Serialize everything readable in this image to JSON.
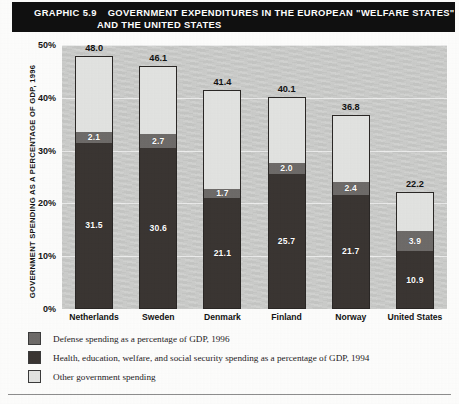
{
  "header": {
    "graphic_number": "GRAPHIC 5.9",
    "title_line_1": "GOVERNMENT EXPENDITURES IN THE EUROPEAN \"WELFARE STATES\"",
    "title_line_2": "AND THE UNITED STATES"
  },
  "colors": {
    "defense": "#6e6b69",
    "health": "#3a3532",
    "other": "#e2e3e1",
    "header_band": "#101010",
    "plot_background": "#c9cac8"
  },
  "legend": {
    "items": [
      {
        "key": "defense",
        "label": "Defense spending as a percentage of GDP, 1996"
      },
      {
        "key": "health",
        "label": "Health, education, welfare, and social security spending as a percentage of GDP, 1994"
      },
      {
        "key": "other",
        "label": "Other government spending"
      }
    ]
  },
  "chart_data": {
    "type": "bar",
    "subtype": "stacked",
    "title": "GOVERNMENT EXPENDITURES IN THE EUROPEAN \"WELFARE STATES\" AND THE UNITED STATES",
    "xlabel": "",
    "ylabel": "GOVERNMENT SPENDING AS A PERCENTAGE OF GDP, 1996",
    "ylim": [
      0,
      50
    ],
    "yticks": [
      0,
      10,
      20,
      30,
      40,
      50
    ],
    "ytick_labels": [
      "0%",
      "10%",
      "20%",
      "30%",
      "40%",
      "50%"
    ],
    "grid": true,
    "legend_position": "below",
    "categories": [
      "Netherlands",
      "Sweden",
      "Denmark",
      "Finland",
      "Norway",
      "United States"
    ],
    "series": [
      {
        "name": "Health, education, welfare, and social security spending as a percentage of GDP, 1994",
        "key": "health",
        "values": [
          31.5,
          30.6,
          21.1,
          25.7,
          21.7,
          10.9
        ]
      },
      {
        "name": "Defense spending as a percentage of GDP, 1996",
        "key": "defense",
        "values": [
          2.1,
          2.7,
          1.7,
          2.0,
          2.4,
          3.9
        ]
      },
      {
        "name": "Other government spending",
        "key": "other",
        "values": [
          14.4,
          12.8,
          18.6,
          12.4,
          12.7,
          7.4
        ]
      }
    ],
    "totals": [
      48.0,
      46.1,
      41.4,
      40.1,
      36.8,
      22.2
    ],
    "total_labels": [
      "48.0",
      "46.1",
      "41.4",
      "40.1",
      "36.8",
      "22.2"
    ],
    "segment_labels": {
      "health": [
        "31.5",
        "30.6",
        "21.1",
        "25.7",
        "21.7",
        "10.9"
      ],
      "defense": [
        "2.1",
        "2.7",
        "1.7",
        "2.0",
        "2.4",
        "3.9"
      ],
      "other": [
        "",
        "",
        "",
        "",
        "",
        ""
      ]
    }
  }
}
